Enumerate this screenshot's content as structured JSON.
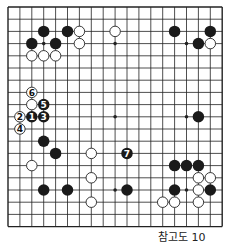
{
  "board": {
    "size": 19,
    "left": 8,
    "top": 7,
    "dx": 11.9,
    "dy": 12.2,
    "line_color": "#222222",
    "black_color": "#1a1a1a",
    "white_fill": "#ffffff",
    "star_points": [
      [
        3,
        3
      ],
      [
        9,
        3
      ],
      [
        15,
        3
      ],
      [
        3,
        9
      ],
      [
        9,
        9
      ],
      [
        15,
        9
      ],
      [
        3,
        15
      ],
      [
        9,
        15
      ],
      [
        15,
        15
      ]
    ],
    "stones": [
      {
        "c": 3,
        "r": 2,
        "color": "black"
      },
      {
        "c": 5,
        "r": 2,
        "color": "black"
      },
      {
        "c": 6,
        "r": 2,
        "color": "white"
      },
      {
        "c": 9,
        "r": 2,
        "color": "white"
      },
      {
        "c": 14,
        "r": 2,
        "color": "black"
      },
      {
        "c": 17,
        "r": 2,
        "color": "black"
      },
      {
        "c": 2,
        "r": 3,
        "color": "black"
      },
      {
        "c": 4,
        "r": 3,
        "color": "black"
      },
      {
        "c": 6,
        "r": 3,
        "color": "white"
      },
      {
        "c": 16,
        "r": 3,
        "color": "black"
      },
      {
        "c": 17,
        "r": 3,
        "color": "white"
      },
      {
        "c": 2,
        "r": 4,
        "color": "white"
      },
      {
        "c": 3,
        "r": 4,
        "color": "white"
      },
      {
        "c": 4,
        "r": 4,
        "color": "white"
      },
      {
        "c": 2,
        "r": 7,
        "color": "white",
        "label": "6"
      },
      {
        "c": 2,
        "r": 8,
        "color": "white"
      },
      {
        "c": 3,
        "r": 8,
        "color": "black",
        "label": "5"
      },
      {
        "c": 1,
        "r": 9,
        "color": "white",
        "label": "2"
      },
      {
        "c": 2,
        "r": 9,
        "color": "black",
        "label": "1"
      },
      {
        "c": 3,
        "r": 9,
        "color": "black",
        "label": "3"
      },
      {
        "c": 16,
        "r": 9,
        "color": "black"
      },
      {
        "c": 1,
        "r": 10,
        "color": "white",
        "label": "4"
      },
      {
        "c": 3,
        "r": 11,
        "color": "black"
      },
      {
        "c": 4,
        "r": 12,
        "color": "black"
      },
      {
        "c": 7,
        "r": 12,
        "color": "white"
      },
      {
        "c": 10,
        "r": 12,
        "color": "black",
        "label": "7"
      },
      {
        "c": 2,
        "r": 13,
        "color": "white"
      },
      {
        "c": 14,
        "r": 13,
        "color": "black"
      },
      {
        "c": 15,
        "r": 13,
        "color": "black"
      },
      {
        "c": 16,
        "r": 13,
        "color": "black"
      },
      {
        "c": 7,
        "r": 14,
        "color": "white"
      },
      {
        "c": 16,
        "r": 14,
        "color": "white"
      },
      {
        "c": 17,
        "r": 14,
        "color": "white"
      },
      {
        "c": 3,
        "r": 15,
        "color": "black"
      },
      {
        "c": 5,
        "r": 15,
        "color": "black"
      },
      {
        "c": 10,
        "r": 15,
        "color": "black"
      },
      {
        "c": 14,
        "r": 15,
        "color": "black"
      },
      {
        "c": 16,
        "r": 15,
        "color": "white"
      },
      {
        "c": 17,
        "r": 15,
        "color": "black"
      },
      {
        "c": 7,
        "r": 16,
        "color": "white"
      },
      {
        "c": 13,
        "r": 16,
        "color": "white"
      },
      {
        "c": 14,
        "r": 16,
        "color": "white"
      },
      {
        "c": 16,
        "r": 16,
        "color": "white"
      }
    ]
  },
  "caption": "참고도 10"
}
